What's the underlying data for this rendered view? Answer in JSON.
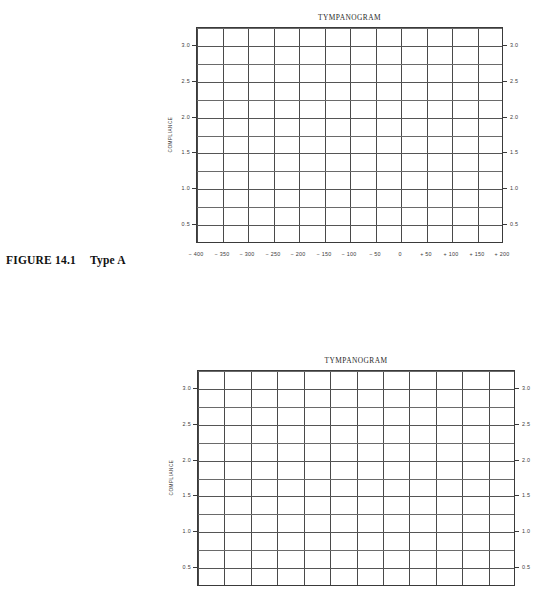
{
  "figure": {
    "number_label": "FIGURE 14.1",
    "type_label": "Type A"
  },
  "charts": [
    {
      "id": "tympanogram-top",
      "title": "TYMPANOGRAM",
      "ylabel": "COMPLIANCE",
      "left": 196,
      "top": 27,
      "width": 307,
      "height": 216,
      "clipped_bottom": false
    },
    {
      "id": "tympanogram-bottom",
      "title": "TYMPANOGRAM",
      "ylabel": "COMPLIANCE",
      "left": 197,
      "top": 370,
      "width": 318,
      "height": 216,
      "clipped_bottom": true
    }
  ],
  "chart_data": [
    {
      "type": "line",
      "title": "TYMPANOGRAM",
      "subtitle": "",
      "xlabel": "",
      "ylabel": "COMPLIANCE",
      "grid": true,
      "legend": "none",
      "series": [],
      "x": [
        -400,
        -350,
        -300,
        -250,
        -200,
        -150,
        -100,
        -50,
        0,
        50,
        100,
        150,
        200
      ],
      "xtick_labels": [
        "− 400",
        "− 350",
        "− 300",
        "− 250",
        "− 200",
        "− 150",
        "− 100",
        "− 50",
        "0",
        "+ 50",
        "+ 100",
        "+ 150",
        "+ 200"
      ],
      "xlim": [
        -400,
        200
      ],
      "xtick_step": 50,
      "ylim": [
        0.25,
        3.25
      ],
      "ytick_labels": [
        "3.0",
        "2.5",
        "2.0",
        "1.5",
        "1.0",
        "0.5"
      ],
      "ytick_values": [
        3.0,
        2.5,
        2.0,
        1.5,
        1.0,
        0.5
      ],
      "ytick_step_major": 0.5,
      "ygrid_step_minor": 0.25,
      "ygrid_values": [
        3.25,
        3.0,
        2.75,
        2.5,
        2.25,
        2.0,
        1.75,
        1.5,
        1.25,
        1.0,
        0.75,
        0.5,
        0.25
      ],
      "ytick_labels_right": [
        "3.0",
        "2.5",
        "2.0",
        "1.5",
        "1.0",
        "0.5"
      ],
      "columns": 12,
      "rows": 12,
      "values": []
    },
    {
      "type": "line",
      "title": "TYMPANOGRAM",
      "subtitle": "",
      "xlabel": "",
      "ylabel": "COMPLIANCE",
      "grid": true,
      "legend": "none",
      "series": [],
      "x": [
        -400,
        -350,
        -300,
        -250,
        -200,
        -150,
        -100,
        -50,
        0,
        50,
        100,
        150,
        200
      ],
      "xtick_labels": [],
      "xlim": [
        -400,
        200
      ],
      "xtick_step": 50,
      "ylim": [
        0.25,
        3.25
      ],
      "ytick_labels": [
        "3.0",
        "2.5",
        "2.0",
        "1.5",
        "1.0",
        "0.5"
      ],
      "ytick_values": [
        3.0,
        2.5,
        2.0,
        1.5,
        1.0,
        0.5
      ],
      "ytick_step_major": 0.5,
      "ygrid_step_minor": 0.25,
      "ygrid_values": [
        3.25,
        3.0,
        2.75,
        2.5,
        2.25,
        2.0,
        1.75,
        1.5,
        1.25,
        1.0,
        0.75,
        0.5,
        0.25
      ],
      "ytick_labels_right": [
        "3.0",
        "2.5",
        "2.0",
        "1.5",
        "1.0",
        "0.5"
      ],
      "columns": 12,
      "rows": 12,
      "values": []
    }
  ],
  "colors": {
    "page_background": "#ffffff",
    "frame_line": "#3a3a3a",
    "grid_line_vertical": "#4a4a4a",
    "grid_line_horizontal": "#6a6a6a",
    "text": "#1a1a1a",
    "tick_text": "#3a3a3a"
  }
}
